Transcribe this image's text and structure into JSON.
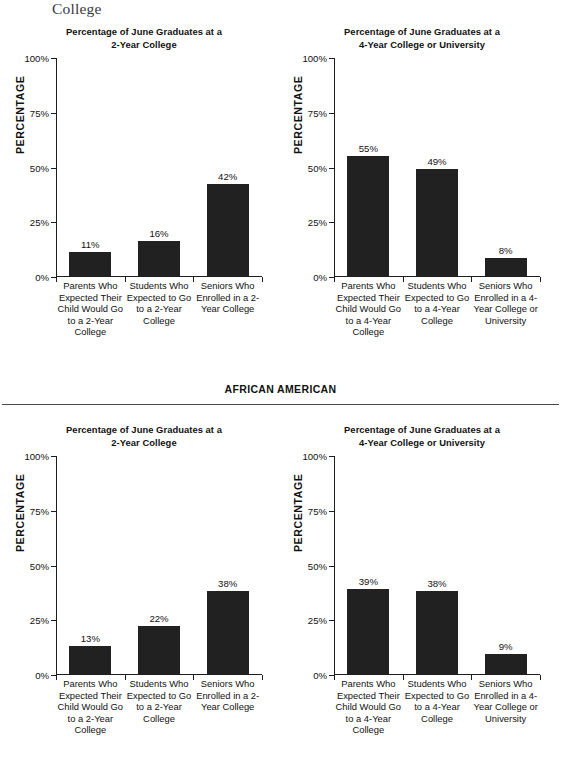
{
  "page": {
    "cut_off_header_line": "",
    "running_title_fragment": "College"
  },
  "sections": [
    {
      "name": "top-section",
      "label": "",
      "has_label": false,
      "charts": [
        {
          "id": "chart-top-left",
          "title_line1": "Percentage of June Graduates at a",
          "title_line2": "2-Year College",
          "y_axis_name": "PERCENTAGE",
          "y_ticks": [
            "100%",
            "75%",
            "50%",
            "25%",
            "0%"
          ],
          "categories": [
            "Parents Who Expected Their Child Would Go to a 2-Year College",
            "Students Who Expected to Go to a 2-Year College",
            "Seniors Who Enrolled in a 2-Year College"
          ],
          "values": [
            11,
            16,
            42
          ],
          "value_labels": [
            "11%",
            "16%",
            "42%"
          ]
        },
        {
          "id": "chart-top-right",
          "title_line1": "Percentage of June Graduates at a",
          "title_line2": "4-Year College or University",
          "y_axis_name": "PERCENTAGE",
          "y_ticks": [
            "100%",
            "75%",
            "50%",
            "25%",
            "0%"
          ],
          "categories": [
            "Parents Who Expected Their Child Would Go to a 4-Year College",
            "Students Who Expected to Go to a 4-Year College",
            "Seniors Who Enrolled in a 4-Year College or University"
          ],
          "values": [
            55,
            49,
            8
          ],
          "value_labels": [
            "55%",
            "49%",
            "8%"
          ]
        }
      ]
    },
    {
      "name": "african-american-section",
      "label": "AFRICAN AMERICAN",
      "has_label": true,
      "charts": [
        {
          "id": "chart-bottom-left",
          "title_line1": "Percentage of June Graduates at a",
          "title_line2": "2-Year College",
          "y_axis_name": "PERCENTAGE",
          "y_ticks": [
            "100%",
            "75%",
            "50%",
            "25%",
            "0%"
          ],
          "categories": [
            "Parents Who Expected Their Child Would Go to a 2-Year College",
            "Students Who Expected to Go to a 2-Year College",
            "Seniors Who Enrolled in a 2-Year College"
          ],
          "values": [
            13,
            22,
            38
          ],
          "value_labels": [
            "13%",
            "22%",
            "38%"
          ]
        },
        {
          "id": "chart-bottom-right",
          "title_line1": "Percentage of June Graduates at a",
          "title_line2": "4-Year College or University",
          "y_axis_name": "PERCENTAGE",
          "y_ticks": [
            "100%",
            "75%",
            "50%",
            "25%",
            "0%"
          ],
          "categories": [
            "Parents Who Expected Their Child Would Go to a 4-Year College",
            "Students Who Expected to Go to a 4-Year College",
            "Seniors Who Enrolled in a 4-Year College or University"
          ],
          "values": [
            39,
            38,
            9
          ],
          "value_labels": [
            "39%",
            "38%",
            "9%"
          ]
        }
      ]
    }
  ],
  "style": {
    "bar_color": "#212121",
    "axis_color": "#1d1d1d",
    "text_color": "#111111",
    "background": "#ffffff"
  },
  "chart_data": [
    {
      "type": "bar",
      "id": "chart-top-left",
      "title": "Percentage of June Graduates at a 2-Year College",
      "xlabel": "",
      "ylabel": "PERCENTAGE",
      "ylim": [
        0,
        100
      ],
      "yticks": [
        0,
        25,
        50,
        75,
        100
      ],
      "ytick_labels": [
        "0%",
        "25%",
        "50%",
        "75%",
        "100%"
      ],
      "grid": false,
      "legend": "none",
      "categories": [
        "Parents Who Expected Their Child Would Go to a 2-Year College",
        "Students Who Expected to Go to a 2-Year College",
        "Seniors Who Enrolled in a 2-Year College"
      ],
      "values": [
        11,
        16,
        42
      ],
      "data_labels": [
        "11%",
        "16%",
        "42%"
      ]
    },
    {
      "type": "bar",
      "id": "chart-top-right",
      "title": "Percentage of June Graduates at a 4-Year College or University",
      "xlabel": "",
      "ylabel": "PERCENTAGE",
      "ylim": [
        0,
        100
      ],
      "yticks": [
        0,
        25,
        50,
        75,
        100
      ],
      "ytick_labels": [
        "0%",
        "25%",
        "50%",
        "75%",
        "100%"
      ],
      "grid": false,
      "legend": "none",
      "categories": [
        "Parents Who Expected Their Child Would Go to a 4-Year College",
        "Students Who Expected to Go to a 4-Year College",
        "Seniors Who Enrolled in a 4-Year College or University"
      ],
      "values": [
        55,
        49,
        8
      ],
      "data_labels": [
        "55%",
        "49%",
        "8%"
      ]
    },
    {
      "type": "bar",
      "id": "chart-bottom-left",
      "section": "AFRICAN AMERICAN",
      "title": "Percentage of June Graduates at a 2-Year College",
      "xlabel": "",
      "ylabel": "PERCENTAGE",
      "ylim": [
        0,
        100
      ],
      "yticks": [
        0,
        25,
        50,
        75,
        100
      ],
      "ytick_labels": [
        "0%",
        "25%",
        "50%",
        "75%",
        "100%"
      ],
      "grid": false,
      "legend": "none",
      "categories": [
        "Parents Who Expected Their Child Would Go to a 2-Year College",
        "Students Who Expected to Go to a 2-Year College",
        "Seniors Who Enrolled in a 2-Year College"
      ],
      "values": [
        13,
        22,
        38
      ],
      "data_labels": [
        "13%",
        "22%",
        "38%"
      ]
    },
    {
      "type": "bar",
      "id": "chart-bottom-right",
      "section": "AFRICAN AMERICAN",
      "title": "Percentage of June Graduates at a 4-Year College or University",
      "xlabel": "",
      "ylabel": "PERCENTAGE",
      "ylim": [
        0,
        100
      ],
      "yticks": [
        0,
        25,
        50,
        75,
        100
      ],
      "ytick_labels": [
        "0%",
        "25%",
        "50%",
        "75%",
        "100%"
      ],
      "grid": false,
      "legend": "none",
      "categories": [
        "Parents Who Expected Their Child Would Go to a 4-Year College",
        "Students Who Expected to Go to a 4-Year College",
        "Seniors Who Enrolled in a 4-Year College or University"
      ],
      "values": [
        39,
        38,
        9
      ],
      "data_labels": [
        "39%",
        "38%",
        "9%"
      ]
    }
  ]
}
